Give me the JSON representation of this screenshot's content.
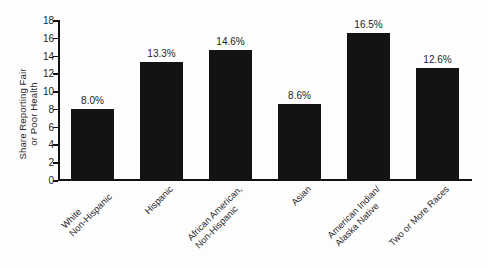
{
  "chart_data": {
    "type": "bar",
    "title": "",
    "xlabel": "",
    "ylabel": "Share Reporting Fair or Poor Health",
    "ylabel_lines": [
      "Share Reporting Fair",
      "or Poor Health"
    ],
    "ylim": [
      0,
      18
    ],
    "ytick_step": 2,
    "grid": false,
    "legend": null,
    "bar_color": "#131313",
    "background_color": "#fdfdfd",
    "axis_color": "#111111",
    "yticks": [
      "0",
      "2",
      "4",
      "6",
      "8",
      "10",
      "12",
      "14",
      "16",
      "18"
    ],
    "categories": [
      "White Non-Hispanic",
      "Hispanic",
      "African American, Non-Hispanic",
      "Asian",
      "American Indian/ Alaska Native",
      "Two or More Races"
    ],
    "category_lines": [
      [
        "White",
        "Non-Hispanic"
      ],
      [
        "Hispanic"
      ],
      [
        "African American,",
        "Non-Hispanic"
      ],
      [
        "Asian"
      ],
      [
        "American Indian/",
        "Alaska Native"
      ],
      [
        "Two or More Races"
      ]
    ],
    "values": [
      8.0,
      13.3,
      14.6,
      8.6,
      16.5,
      12.6
    ],
    "value_labels": [
      "8.0%",
      "13.3%",
      "14.6%",
      "8.6%",
      "16.5%",
      "12.6%"
    ]
  }
}
